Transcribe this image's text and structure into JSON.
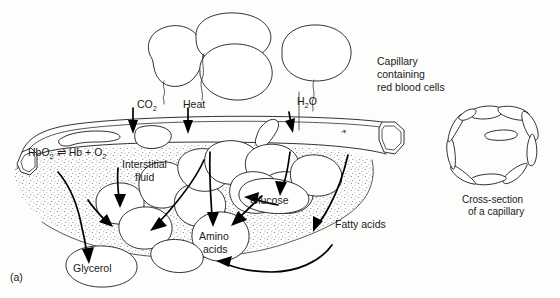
{
  "figure": {
    "panel_label": "(a)",
    "background_color": "#fdfdfc",
    "ink_color": "#1a1a1a"
  },
  "labels": {
    "co2": "CO",
    "co2_sub": "2",
    "heat": "Heat",
    "h2o_h": "H",
    "h2o_sub": "2",
    "h2o_o": "O",
    "capillary_note_line1": "Capillary",
    "capillary_note_line2": "containing",
    "capillary_note_line3": "red blood cells",
    "hb_part1": "HbO",
    "hb_sub1": "2",
    "hb_eq": "⇌",
    "hb_part2": "Hb + O",
    "hb_sub2": "2",
    "interstitial_line1": "Interstitial",
    "interstitial_line2": "fluid",
    "glucose": "Glucose",
    "fatty_acids": "Fatty acids",
    "amino_line1": "Amino",
    "amino_line2": "acids",
    "glycerol": "Glycerol",
    "cross_line1": "Cross-section",
    "cross_line2": "of a capillary"
  }
}
